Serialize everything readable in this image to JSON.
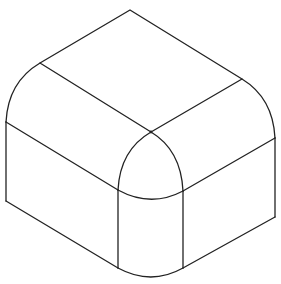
{
  "figure": {
    "background": "#ffffff",
    "line_color": "#222222",
    "line_width": 1.3
  }
}
